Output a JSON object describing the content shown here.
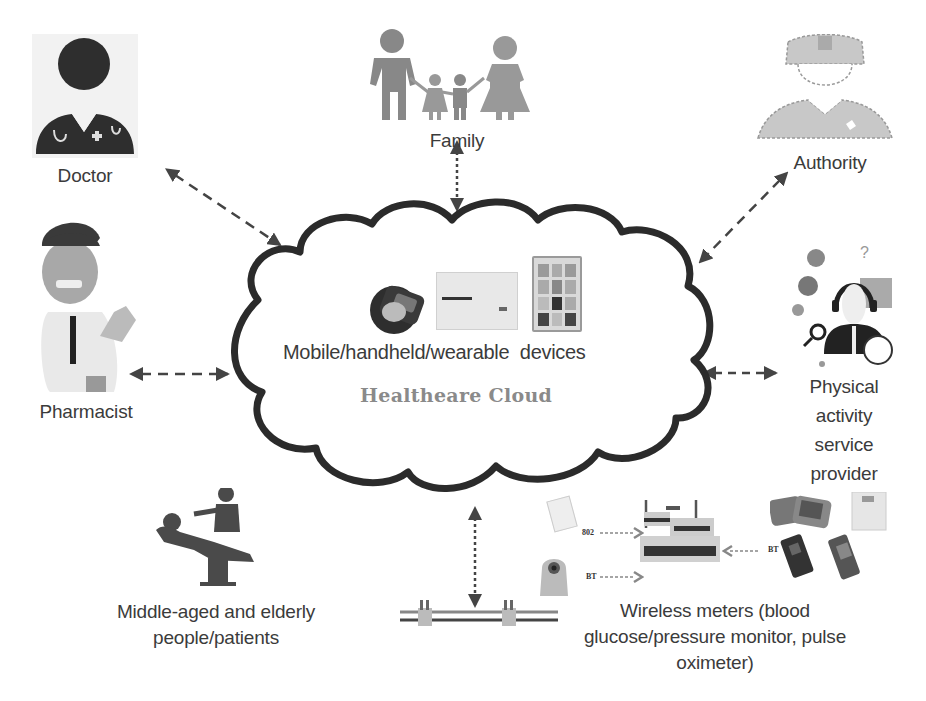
{
  "diagram": {
    "cloud": {
      "title": "Healtheare Cloud",
      "devices_label": "Mobile/handheld/wearable  devices",
      "stroke_color": "#2b2b2b",
      "title_color": "#8a8a8a"
    },
    "nodes": [
      {
        "id": "doctor",
        "label": "Doctor",
        "icon": "doctor-icon"
      },
      {
        "id": "family",
        "label": "Family",
        "icon": "family-icon"
      },
      {
        "id": "authority",
        "label": "Authority",
        "icon": "police-officer-icon"
      },
      {
        "id": "pharmacist",
        "label": "Pharmacist",
        "icon": "pharmacist-icon"
      },
      {
        "id": "physical_activity",
        "label_lines": [
          "Physical",
          "activity",
          "service",
          "provider"
        ],
        "icon": "call-center-agent-icon"
      },
      {
        "id": "patients",
        "label_lines": [
          "Middle-aged and elderly",
          "people/patients"
        ],
        "icon": "patient-bed-icon"
      },
      {
        "id": "wireless_meters",
        "label_lines": [
          "Wireless meters (blood",
          "glucose/pressure monitor, pulse",
          "oximeter)"
        ],
        "icon": "wireless-router-icon"
      }
    ],
    "connections": [
      {
        "from": "doctor",
        "to": "cloud",
        "style": "dashed",
        "bidirectional": true
      },
      {
        "from": "family",
        "to": "cloud",
        "style": "dotted",
        "bidirectional": true
      },
      {
        "from": "authority",
        "to": "cloud",
        "style": "dashed",
        "bidirectional": true
      },
      {
        "from": "pharmacist",
        "to": "cloud",
        "style": "dashed",
        "bidirectional": true
      },
      {
        "from": "physical_activity",
        "to": "cloud",
        "style": "dashed",
        "bidirectional": true
      },
      {
        "from": "sensor_bar",
        "to": "cloud",
        "style": "dotted",
        "bidirectional": true
      }
    ],
    "router_link_labels": {
      "top_left": "802",
      "bottom_left": "BT",
      "right": "BT"
    }
  }
}
